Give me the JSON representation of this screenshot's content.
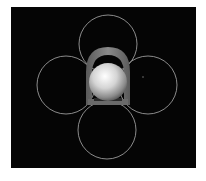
{
  "figure": {
    "background": "#050505",
    "border_color": "#ffffff",
    "circles": [
      {
        "name": "top",
        "cx": 108,
        "cy": 44,
        "r": 29
      },
      {
        "name": "left",
        "cx": 66,
        "cy": 85,
        "r": 29
      },
      {
        "name": "right",
        "cx": 148,
        "cy": 85,
        "r": 29
      },
      {
        "name": "bottom",
        "cx": 107,
        "cy": 130,
        "r": 29
      }
    ],
    "circle_color": "#9a9a9a",
    "sphere": {
      "cx": 108,
      "cy": 82,
      "r": 19
    },
    "bracket_color": "#6e6e6e"
  }
}
